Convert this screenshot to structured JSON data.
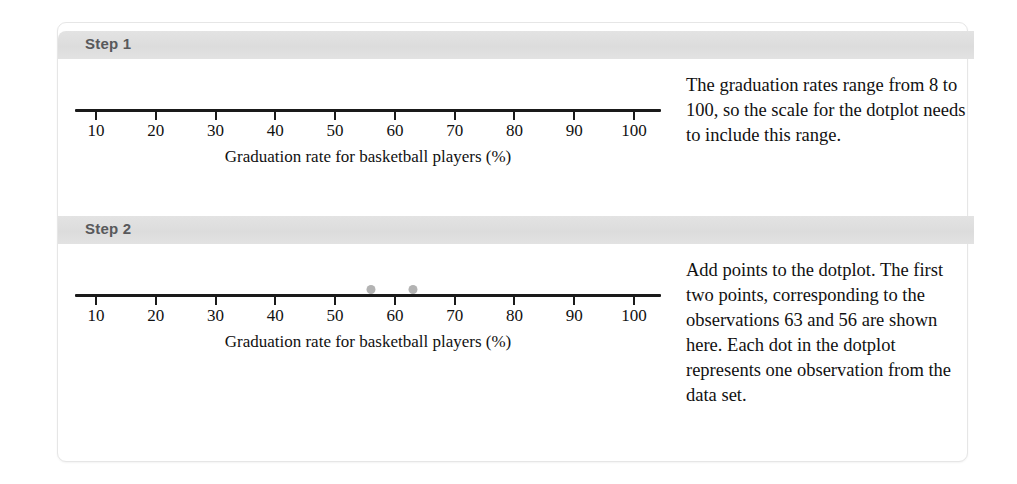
{
  "colors": {
    "banner": "#e0e0e0",
    "banner_text": "#58595b",
    "axis": "#1a1a1a",
    "dot": "#b3b3b3",
    "card_border": "#e6e6e6",
    "page_background": "#ffffff"
  },
  "steps": [
    {
      "label": "Step 1",
      "note": "The graduation rates range from 8 to 100, so the scale for the dotplot needs to include this range.",
      "chart_ref": 0
    },
    {
      "label": "Step 2",
      "note": "Add points to the dotplot. The first two points, corresponding to the observations 63 and 56 are shown here. Each dot in the dotplot represents one observation from the data set.",
      "chart_ref": 1
    }
  ],
  "chart_data": [
    {
      "type": "scatter",
      "title": "",
      "xlabel": "Graduation rate for basketball players (%)",
      "ylabel": "",
      "xlim": [
        10,
        100
      ],
      "xticks": [
        10,
        20,
        30,
        40,
        50,
        60,
        70,
        80,
        90,
        100
      ],
      "xticklabels": [
        "10",
        "20",
        "30",
        "40",
        "50",
        "60",
        "70",
        "80",
        "90",
        "100"
      ],
      "values": [],
      "grid": false,
      "legend": false,
      "note": "Empty axis - scale only, no data points plotted yet"
    },
    {
      "type": "scatter",
      "title": "",
      "xlabel": "Graduation rate for basketball players (%)",
      "ylabel": "",
      "xlim": [
        10,
        100
      ],
      "xticks": [
        10,
        20,
        30,
        40,
        50,
        60,
        70,
        80,
        90,
        100
      ],
      "xticklabels": [
        "10",
        "20",
        "30",
        "40",
        "50",
        "60",
        "70",
        "80",
        "90",
        "100"
      ],
      "values": [
        56,
        63
      ],
      "grid": false,
      "legend": false,
      "note": "Dotplot with the first two observations plotted at 56 and 63"
    }
  ]
}
